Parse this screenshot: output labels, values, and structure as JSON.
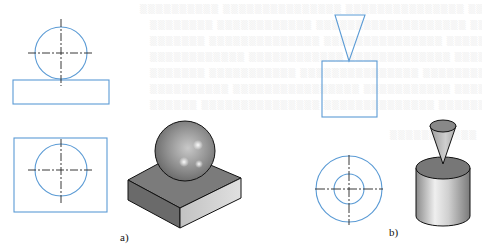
{
  "figure": {
    "panels": [
      {
        "id": "a",
        "label": "a)",
        "description": "Sphere resting on a rectangular block",
        "views": [
          "front-view",
          "top-view",
          "isometric-render"
        ]
      },
      {
        "id": "b",
        "label": "b)",
        "description": "Inverted cone resting on a cylinder",
        "views": [
          "front-view",
          "top-view",
          "isometric-render"
        ]
      }
    ],
    "colors": {
      "outline_blue": "#5b9bd5",
      "centerline": "#222222",
      "shade_dark": "#6e6e6e",
      "shade_mid": "#9a9a9a",
      "shade_light": "#d9d9d9",
      "background": "#ffffff"
    }
  }
}
